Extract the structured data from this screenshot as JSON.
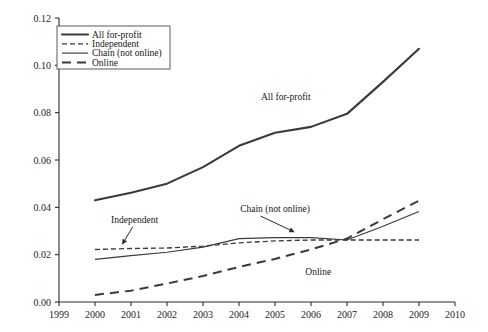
{
  "chart_data": {
    "type": "line",
    "title": "",
    "subtitle": "",
    "xlabel": "",
    "ylabel": "",
    "xlim": [
      1999,
      2010
    ],
    "ylim": [
      0.0,
      0.12
    ],
    "grid": false,
    "legend_position": "top-left",
    "x": [
      2000,
      2001,
      2002,
      2003,
      2004,
      2005,
      2006,
      2007,
      2008,
      2009
    ],
    "x_ticks": [
      "1999",
      "2000",
      "2001",
      "2002",
      "2003",
      "2004",
      "2005",
      "2006",
      "2007",
      "2008",
      "2009",
      "2010"
    ],
    "y_ticks": [
      "0.00",
      "0.02",
      "0.04",
      "0.06",
      "0.08",
      "0.10",
      "0.12"
    ],
    "series": [
      {
        "name": "All for-profit",
        "style": "solid-thick",
        "values": [
          0.043,
          0.0462,
          0.05,
          0.057,
          0.066,
          0.0715,
          0.074,
          0.0795,
          0.093,
          0.107
        ]
      },
      {
        "name": "Independent",
        "style": "dashed-fine",
        "values": [
          0.0222,
          0.0226,
          0.0228,
          0.0236,
          0.025,
          0.0258,
          0.0262,
          0.0262,
          0.0262,
          0.0262
        ]
      },
      {
        "name": "Chain (not online)",
        "style": "solid-thin",
        "values": [
          0.018,
          0.0196,
          0.021,
          0.0232,
          0.0268,
          0.0272,
          0.0272,
          0.0262,
          0.032,
          0.0382
        ]
      },
      {
        "name": "Online",
        "style": "dashed-long",
        "values": [
          0.003,
          0.0048,
          0.0078,
          0.011,
          0.0148,
          0.0182,
          0.0222,
          0.0268,
          0.035,
          0.0428
        ]
      }
    ],
    "annotations": [
      {
        "text": "All for-profit",
        "x": 2005.3,
        "y": 0.087
      },
      {
        "text": "Independent",
        "x": 2001.1,
        "y": 0.035
      },
      {
        "text": "Chain (not online)",
        "x": 2005.0,
        "y": 0.0395
      },
      {
        "text": "Online",
        "x": 2006.2,
        "y": 0.0128
      }
    ]
  },
  "legend": {
    "entries": [
      {
        "label": "All for-profit"
      },
      {
        "label": "Independent"
      },
      {
        "label": "Chain (not online)"
      },
      {
        "label": "Online"
      }
    ]
  }
}
